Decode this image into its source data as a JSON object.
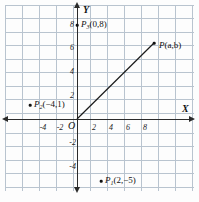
{
  "figure": {
    "axes": {
      "x_name": "X",
      "y_name": "Y",
      "origin_label": "O",
      "x_ticks": [
        "-4",
        "-2",
        "2",
        "4",
        "6",
        "8"
      ],
      "x_tick_values": [
        -4,
        -2,
        2,
        4,
        6,
        8
      ],
      "y_ticks": [
        "8",
        "6",
        "4",
        "2",
        "-2",
        "-4"
      ],
      "y_tick_values": [
        8,
        6,
        4,
        2,
        -2,
        -4
      ],
      "xlim": [
        -5,
        9.5
      ],
      "ylim": [
        -5.5,
        9
      ],
      "grid": true,
      "grid_step": 1
    },
    "points": [
      {
        "name": "P3",
        "base": "P",
        "sub": "3",
        "coords": "(0,8)",
        "x": 0,
        "y": 8,
        "label": "P3(0,8)"
      },
      {
        "name": "P2",
        "base": "P",
        "sub": "2",
        "coords": "(−4,1)",
        "x": -4,
        "y": 1,
        "label": "P2(−4,1)"
      },
      {
        "name": "P1",
        "base": "P",
        "sub": "1",
        "coords": "(2,−5)",
        "x": 2,
        "y": -5,
        "label": "P1(2,−5)"
      },
      {
        "name": "P",
        "base": "P",
        "sub": "",
        "coords": "(a,b)",
        "x": 6.8,
        "y": 6.4,
        "label": "P(a,b)"
      }
    ],
    "segment": {
      "from": [
        0,
        0
      ],
      "to": [
        6.8,
        6.4
      ],
      "label": "OP"
    },
    "colors": {
      "grid": "#b9c4cf",
      "axis": "#2b2b2b",
      "text": "#111111",
      "background": "#fdfdfd"
    }
  }
}
